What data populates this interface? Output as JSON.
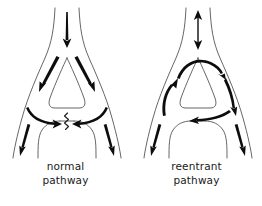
{
  "figure": {
    "background_color": "#ffffff",
    "outline_color": "#4a4a4a",
    "arrow_color": "#0d0d0d",
    "panels": [
      {
        "id": "normal",
        "caption_line1": "normal",
        "caption_line2": "pathway",
        "icons": [
          "down-arrow-icon",
          "down-left-arrow-icon",
          "down-right-arrow-icon",
          "curved-right-arrow-icon",
          "curved-left-arrow-icon",
          "leg-left-down-arrow-icon",
          "leg-right-down-arrow-icon",
          "conduction-block-zigzag-icon"
        ]
      },
      {
        "id": "reentrant",
        "caption_line1": "reentrant",
        "caption_line2": "pathway",
        "icons": [
          "double-headed-vertical-arrow-icon",
          "curved-top-right-arrow-icon",
          "up-left-arrow-icon",
          "down-right-arrow-icon",
          "leftward-arrow-icon",
          "leg-left-down-arrow-icon",
          "leg-right-down-arrow-icon"
        ]
      }
    ]
  }
}
